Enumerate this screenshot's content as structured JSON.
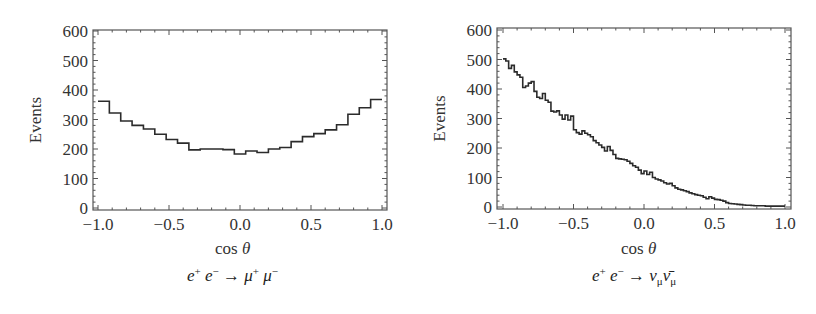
{
  "chart_data": [
    {
      "type": "bar",
      "style": "step-histogram",
      "title": "",
      "caption": "e+ e- → μ+ μ-",
      "caption_parts": {
        "a": "e",
        "a_sup": "+",
        "b": "e",
        "b_sup": "−",
        "arrow": "→",
        "c": "μ",
        "c_sup": "+",
        "d": "μ",
        "d_sup": "−"
      },
      "xlabel": "cos θ",
      "xlabel_parts": {
        "prefix": "cos ",
        "var": "θ"
      },
      "ylabel": "Events",
      "xlim": [
        -1.0,
        1.0
      ],
      "ylim": [
        0,
        600
      ],
      "xticks": [
        "−1.0",
        "−0.5",
        "0.0",
        "0.5",
        "1.0"
      ],
      "xtick_values": [
        -1.0,
        -0.5,
        0.0,
        0.5,
        1.0
      ],
      "yticks": [
        "0",
        "100",
        "200",
        "300",
        "400",
        "500",
        "600"
      ],
      "ytick_values": [
        0,
        100,
        200,
        300,
        400,
        500,
        600
      ],
      "grid": false,
      "legend": null,
      "bin_edges_start": -1.0,
      "bin_width": 0.08,
      "values": [
        362,
        322,
        295,
        280,
        268,
        250,
        232,
        220,
        197,
        200,
        200,
        198,
        183,
        193,
        188,
        200,
        205,
        225,
        242,
        252,
        265,
        282,
        318,
        340,
        368
      ]
    },
    {
      "type": "bar",
      "style": "step-histogram",
      "title": "",
      "caption": "e+ e- → ν_μ ν̄_μ",
      "caption_parts": {
        "a": "e",
        "a_sup": "+",
        "b": "e",
        "b_sup": "−",
        "arrow": "→",
        "c": "ν",
        "c_sub": "μ",
        "d": "ν̄",
        "d_sub": "μ"
      },
      "xlabel": "cos θ",
      "xlabel_parts": {
        "prefix": "cos ",
        "var": "θ"
      },
      "ylabel": "Events",
      "xlim": [
        -1.0,
        1.0
      ],
      "ylim": [
        0,
        600
      ],
      "xticks": [
        "−1.0",
        "−0.5",
        "0.0",
        "0.5",
        "1.0"
      ],
      "xtick_values": [
        -1.0,
        -0.5,
        0.0,
        0.5,
        1.0
      ],
      "yticks": [
        "0",
        "100",
        "200",
        "300",
        "400",
        "500",
        "600"
      ],
      "ytick_values": [
        0,
        100,
        200,
        300,
        400,
        500,
        600
      ],
      "grid": false,
      "legend": null,
      "bin_edges_start": -1.0,
      "bin_width": 0.02,
      "values": [
        502,
        495,
        470,
        480,
        458,
        448,
        440,
        405,
        410,
        420,
        425,
        392,
        372,
        368,
        385,
        362,
        355,
        325,
        322,
        326,
        312,
        298,
        312,
        295,
        308,
        262,
        252,
        247,
        258,
        250,
        245,
        238,
        225,
        218,
        210,
        202,
        190,
        205,
        192,
        178,
        165,
        163,
        162,
        160,
        155,
        148,
        140,
        135,
        125,
        113,
        122,
        110,
        118,
        100,
        95,
        92,
        88,
        82,
        78,
        80,
        72,
        65,
        60,
        58,
        55,
        52,
        48,
        45,
        42,
        40,
        38,
        33,
        28,
        35,
        30,
        26,
        25,
        23,
        20,
        15,
        12,
        11,
        10,
        9,
        8,
        7,
        6,
        6,
        5,
        4,
        4,
        4,
        4,
        3,
        3,
        3,
        3,
        3,
        3,
        3
      ]
    }
  ],
  "colors": {
    "line": "#2b2b2b",
    "frame": "#555555",
    "background": "#ffffff"
  }
}
